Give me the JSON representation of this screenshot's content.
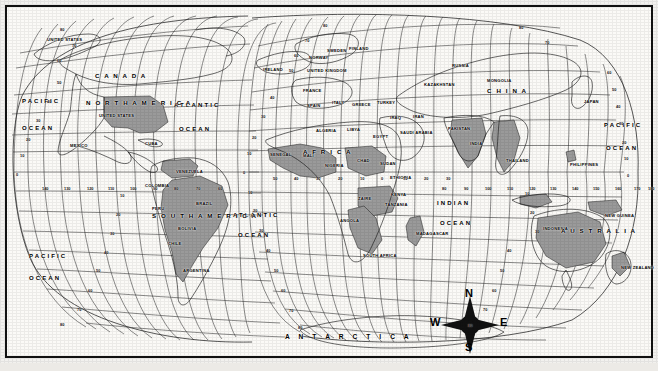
{
  "map": {
    "type": "world-map",
    "projection": "interrupted-sinusoidal/mollweide-style graticule",
    "frame_color": "#111111",
    "background_color": "#fbfaf7",
    "shaded_country_color": "#9a9a9a",
    "coastline_color": "#1a1a1a",
    "graticule_color": "#2a2a2a",
    "continents": [
      {
        "name": "CANADA",
        "x": 95,
        "y": 72
      },
      {
        "name": "NORTH AMERICA",
        "x": 86,
        "y": 99
      },
      {
        "name": "SOUTH AMERICA",
        "x": 152,
        "y": 212
      },
      {
        "name": "AFRICA",
        "x": 303,
        "y": 148
      },
      {
        "name": "CHINA",
        "x": 487,
        "y": 87
      },
      {
        "name": "AUSTRALIA",
        "x": 561,
        "y": 227
      },
      {
        "name": "ANTARCTICA",
        "x": 285,
        "y": 333
      }
    ],
    "countries": [
      {
        "name": "UNITED STATES",
        "x": 47,
        "y": 37,
        "region": "alaska"
      },
      {
        "name": "UNITED STATES",
        "x": 99,
        "y": 113,
        "region": "conus"
      },
      {
        "name": "MEXICO",
        "x": 70,
        "y": 143
      },
      {
        "name": "CUBA",
        "x": 145,
        "y": 141
      },
      {
        "name": "VENEZUELA",
        "x": 176,
        "y": 169
      },
      {
        "name": "COLOMBIA",
        "x": 145,
        "y": 183
      },
      {
        "name": "PERU",
        "x": 152,
        "y": 206
      },
      {
        "name": "BRAZIL",
        "x": 196,
        "y": 201
      },
      {
        "name": "BOLIVIA",
        "x": 178,
        "y": 226
      },
      {
        "name": "CHILE",
        "x": 168,
        "y": 241
      },
      {
        "name": "ARGENTINA",
        "x": 183,
        "y": 268
      },
      {
        "name": "IRELAND",
        "x": 263,
        "y": 67
      },
      {
        "name": "UNITED KINGDOM",
        "x": 307,
        "y": 68
      },
      {
        "name": "NORWAY",
        "x": 309,
        "y": 55
      },
      {
        "name": "SWEDEN",
        "x": 327,
        "y": 48
      },
      {
        "name": "FINLAND",
        "x": 349,
        "y": 46
      },
      {
        "name": "FRANCE",
        "x": 303,
        "y": 88
      },
      {
        "name": "SPAIN",
        "x": 307,
        "y": 103
      },
      {
        "name": "ITALY",
        "x": 332,
        "y": 100
      },
      {
        "name": "GREECE",
        "x": 352,
        "y": 102
      },
      {
        "name": "TURKEY",
        "x": 377,
        "y": 100
      },
      {
        "name": "KAZAKHSTAN",
        "x": 424,
        "y": 82
      },
      {
        "name": "RUSSIA",
        "x": 452,
        "y": 63
      },
      {
        "name": "MONGOLIA",
        "x": 487,
        "y": 78
      },
      {
        "name": "JAPAN",
        "x": 584,
        "y": 99
      },
      {
        "name": "IRAQ",
        "x": 390,
        "y": 115
      },
      {
        "name": "IRAN",
        "x": 413,
        "y": 114
      },
      {
        "name": "SAUDI ARABIA",
        "x": 400,
        "y": 130
      },
      {
        "name": "PAKISTAN",
        "x": 448,
        "y": 126
      },
      {
        "name": "INDIA",
        "x": 470,
        "y": 141
      },
      {
        "name": "THAILAND",
        "x": 506,
        "y": 158
      },
      {
        "name": "PHILIPPINES",
        "x": 570,
        "y": 162
      },
      {
        "name": "INDONESIA",
        "x": 543,
        "y": 226
      },
      {
        "name": "NEW GUINEA",
        "x": 605,
        "y": 213
      },
      {
        "name": "NEW ZEALAND",
        "x": 621,
        "y": 265
      },
      {
        "name": "ALGERIA",
        "x": 316,
        "y": 128
      },
      {
        "name": "LIBYA",
        "x": 347,
        "y": 127
      },
      {
        "name": "EGYPT",
        "x": 373,
        "y": 134
      },
      {
        "name": "SENEGAL",
        "x": 270,
        "y": 152
      },
      {
        "name": "MALI",
        "x": 303,
        "y": 153
      },
      {
        "name": "NIGERIA",
        "x": 325,
        "y": 163
      },
      {
        "name": "CHAD",
        "x": 357,
        "y": 158
      },
      {
        "name": "SUDAN",
        "x": 380,
        "y": 161
      },
      {
        "name": "ETHIOPIA",
        "x": 390,
        "y": 175
      },
      {
        "name": "KENYA",
        "x": 391,
        "y": 192
      },
      {
        "name": "ZAIRE",
        "x": 358,
        "y": 196
      },
      {
        "name": "TANZANIA",
        "x": 385,
        "y": 202
      },
      {
        "name": "ANGOLA",
        "x": 340,
        "y": 218
      },
      {
        "name": "MADAGASCAR",
        "x": 416,
        "y": 231
      },
      {
        "name": "SOUTH AFRICA",
        "x": 363,
        "y": 253
      }
    ],
    "oceans": [
      {
        "name": "PACIFIC",
        "x": 22,
        "y": 98
      },
      {
        "name": "OCEAN",
        "x": 22,
        "y": 125
      },
      {
        "name": "PACIFIC",
        "x": 29,
        "y": 253
      },
      {
        "name": "OCEAN",
        "x": 29,
        "y": 275
      },
      {
        "name": "ATLANTIC",
        "x": 174,
        "y": 102
      },
      {
        "name": "OCEAN",
        "x": 179,
        "y": 126
      },
      {
        "name": "ATLANTIC",
        "x": 233,
        "y": 212
      },
      {
        "name": "OCEAN",
        "x": 238,
        "y": 232
      },
      {
        "name": "INDIAN",
        "x": 437,
        "y": 200
      },
      {
        "name": "OCEAN",
        "x": 440,
        "y": 220
      },
      {
        "name": "PACIFIC",
        "x": 604,
        "y": 122
      },
      {
        "name": "OCEAN",
        "x": 606,
        "y": 145
      }
    ],
    "latitude_ticks": [
      {
        "value": "80",
        "x": 323,
        "y": 23
      },
      {
        "value": "70",
        "x": 305,
        "y": 38
      },
      {
        "value": "60",
        "x": 294,
        "y": 53
      },
      {
        "value": "50",
        "x": 289,
        "y": 68
      },
      {
        "value": "40",
        "x": 270,
        "y": 95
      },
      {
        "value": "30",
        "x": 261,
        "y": 114
      },
      {
        "value": "20",
        "x": 252,
        "y": 135
      },
      {
        "value": "10",
        "x": 247,
        "y": 151
      },
      {
        "value": "0",
        "x": 243,
        "y": 170
      },
      {
        "value": "10",
        "x": 248,
        "y": 190
      },
      {
        "value": "20",
        "x": 253,
        "y": 208
      },
      {
        "value": "30",
        "x": 259,
        "y": 228
      },
      {
        "value": "40",
        "x": 266,
        "y": 248
      },
      {
        "value": "50",
        "x": 274,
        "y": 268
      },
      {
        "value": "60",
        "x": 281,
        "y": 288
      },
      {
        "value": "70",
        "x": 289,
        "y": 308
      },
      {
        "value": "80",
        "x": 298,
        "y": 325
      },
      {
        "value": "80",
        "x": 60,
        "y": 27
      },
      {
        "value": "70",
        "x": 72,
        "y": 43
      },
      {
        "value": "60",
        "x": 57,
        "y": 58
      },
      {
        "value": "50",
        "x": 57,
        "y": 80
      },
      {
        "value": "40",
        "x": 47,
        "y": 99
      },
      {
        "value": "30",
        "x": 36,
        "y": 118
      },
      {
        "value": "20",
        "x": 26,
        "y": 137
      },
      {
        "value": "10",
        "x": 20,
        "y": 153
      },
      {
        "value": "0",
        "x": 16,
        "y": 172
      },
      {
        "value": "80",
        "x": 519,
        "y": 25
      },
      {
        "value": "70",
        "x": 545,
        "y": 40
      },
      {
        "value": "60",
        "x": 607,
        "y": 70
      },
      {
        "value": "50",
        "x": 612,
        "y": 87
      },
      {
        "value": "40",
        "x": 616,
        "y": 104
      },
      {
        "value": "30",
        "x": 619,
        "y": 121
      },
      {
        "value": "20",
        "x": 622,
        "y": 140
      },
      {
        "value": "10",
        "x": 624,
        "y": 156
      },
      {
        "value": "0",
        "x": 627,
        "y": 173
      },
      {
        "value": "10",
        "x": 120,
        "y": 193
      },
      {
        "value": "20",
        "x": 116,
        "y": 212
      },
      {
        "value": "30",
        "x": 110,
        "y": 231
      },
      {
        "value": "40",
        "x": 104,
        "y": 250
      },
      {
        "value": "50",
        "x": 96,
        "y": 268
      },
      {
        "value": "60",
        "x": 88,
        "y": 288
      },
      {
        "value": "70",
        "x": 77,
        "y": 307
      },
      {
        "value": "80",
        "x": 60,
        "y": 322
      },
      {
        "value": "10",
        "x": 525,
        "y": 191
      },
      {
        "value": "20",
        "x": 530,
        "y": 210
      },
      {
        "value": "30",
        "x": 535,
        "y": 229
      },
      {
        "value": "40",
        "x": 507,
        "y": 248
      },
      {
        "value": "50",
        "x": 500,
        "y": 268
      },
      {
        "value": "60",
        "x": 492,
        "y": 288
      },
      {
        "value": "70",
        "x": 483,
        "y": 307
      },
      {
        "value": "80",
        "x": 468,
        "y": 323
      }
    ],
    "longitude_ticks": [
      {
        "value": "140",
        "x": 42,
        "y": 186
      },
      {
        "value": "130",
        "x": 64,
        "y": 186
      },
      {
        "value": "120",
        "x": 87,
        "y": 186
      },
      {
        "value": "110",
        "x": 108,
        "y": 186
      },
      {
        "value": "100",
        "x": 130,
        "y": 186
      },
      {
        "value": "90",
        "x": 153,
        "y": 186
      },
      {
        "value": "80",
        "x": 174,
        "y": 186
      },
      {
        "value": "70",
        "x": 196,
        "y": 186
      },
      {
        "value": "60",
        "x": 218,
        "y": 186
      },
      {
        "value": "50",
        "x": 273,
        "y": 176
      },
      {
        "value": "40",
        "x": 294,
        "y": 176
      },
      {
        "value": "30",
        "x": 316,
        "y": 176
      },
      {
        "value": "20",
        "x": 338,
        "y": 176
      },
      {
        "value": "10",
        "x": 360,
        "y": 176
      },
      {
        "value": "0",
        "x": 381,
        "y": 176
      },
      {
        "value": "10",
        "x": 403,
        "y": 176
      },
      {
        "value": "20",
        "x": 424,
        "y": 176
      },
      {
        "value": "30",
        "x": 446,
        "y": 176
      },
      {
        "value": "80",
        "x": 442,
        "y": 186
      },
      {
        "value": "90",
        "x": 464,
        "y": 186
      },
      {
        "value": "100",
        "x": 485,
        "y": 186
      },
      {
        "value": "110",
        "x": 507,
        "y": 186
      },
      {
        "value": "120",
        "x": 529,
        "y": 186
      },
      {
        "value": "130",
        "x": 550,
        "y": 186
      },
      {
        "value": "140",
        "x": 572,
        "y": 186
      },
      {
        "value": "150",
        "x": 593,
        "y": 186
      },
      {
        "value": "160",
        "x": 615,
        "y": 186
      },
      {
        "value": "170",
        "x": 634,
        "y": 186
      },
      {
        "value": "180",
        "x": 648,
        "y": 186
      }
    ],
    "compass": {
      "center_x": 470,
      "center_y": 325,
      "north": "N",
      "south": "S",
      "east": "E",
      "west": "W"
    }
  }
}
